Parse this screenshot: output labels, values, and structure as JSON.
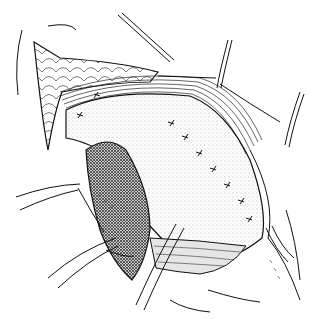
{
  "image": {
    "kind": "surgical line illustration",
    "width": 316,
    "height": 319,
    "background": "#ffffff",
    "ink": "#111111",
    "stipple": "#555555",
    "dark_tissue": "#2a2a2a",
    "labels": []
  },
  "elements": {
    "retractors": [
      "retractor-top-left",
      "retractor-top-right-1",
      "retractor-top-right-2",
      "retractor-left-upper",
      "retractor-left-lower",
      "retractor-bottom"
    ],
    "tissues": [
      "fat-flap",
      "muscle-fibers",
      "stippled-organ",
      "dark-organ-segment",
      "lower-muscle-band",
      "skin-edge-right"
    ],
    "sutures_count": 9
  }
}
